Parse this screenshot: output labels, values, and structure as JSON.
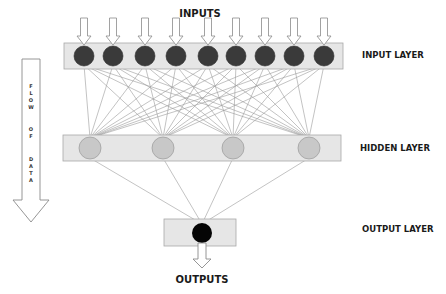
{
  "labels": {
    "inputs": "INPUTS",
    "outputs": "OUTPUTS",
    "input_layer": "INPUT LAYER",
    "hidden_layer": "HIDDEN LAYER",
    "output_layer": "OUTPUT LAYER",
    "flow": [
      "F",
      "L",
      "O",
      "W",
      "O",
      "F",
      "D",
      "A",
      "T",
      "A"
    ]
  },
  "colors": {
    "layer_fill": "#e6e6e6",
    "layer_stroke": "#a8a8a8",
    "input_node": "#3a3a3a",
    "hidden_node": "#c8c8c8",
    "hidden_stroke": "#9a9a9a",
    "output_node": "#050505",
    "edge": "#9a9a9a",
    "arrow_stroke": "#8a8a8a"
  },
  "layers": {
    "input": {
      "rect": [
        64,
        43,
        279,
        26
      ],
      "node_y": 56,
      "r": 10,
      "nodes_x": [
        84,
        113,
        145,
        176,
        208,
        236,
        265,
        294,
        324
      ]
    },
    "hidden": {
      "rect": [
        63,
        135,
        278,
        26
      ],
      "node_y": 148,
      "r": 11,
      "nodes_x": [
        90,
        163,
        233,
        309
      ]
    },
    "output": {
      "rect": [
        164,
        219,
        72,
        27
      ],
      "node_y": 233,
      "r": 10,
      "nodes_x": [
        202
      ]
    }
  }
}
